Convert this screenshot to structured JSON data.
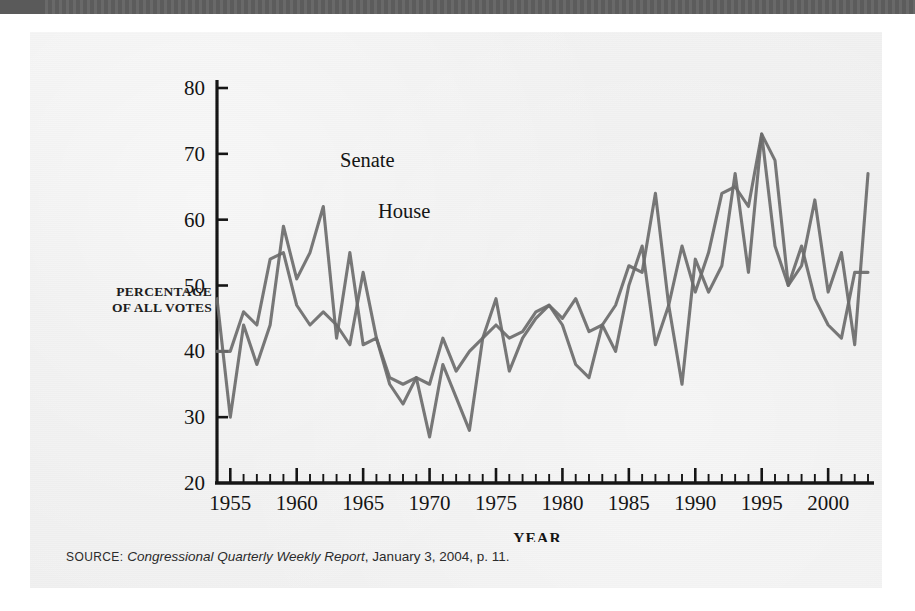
{
  "topbar": {
    "present": true,
    "color": "#5a5a5a"
  },
  "figure": {
    "panel_color": "#efefef",
    "y_axis_title_line1": "PERCENTAGE",
    "y_axis_title_line2": "OF ALL VOTES",
    "x_axis_title": "YEAR",
    "source_prefix": "SOURCE:",
    "source_italic": "Congressional Quarterly Weekly Report",
    "source_rest": ", January 3, 2004, p. 11.",
    "series_label_senate": "Senate",
    "series_label_house": "House",
    "line_color": "#6b6b6b",
    "axis_color": "#141414"
  },
  "chart_data": {
    "type": "line",
    "title": "",
    "xlabel": "YEAR",
    "ylabel": "PERCENTAGE OF ALL VOTES",
    "xlim": [
      1954,
      2003
    ],
    "ylim": [
      20,
      80
    ],
    "yticks": [
      20,
      30,
      40,
      50,
      60,
      70,
      80
    ],
    "xticks_major": [
      1955,
      1960,
      1965,
      1970,
      1975,
      1980,
      1985,
      1990,
      1995,
      2000
    ],
    "xtick_minor_step": 1,
    "grid": false,
    "legend": "inline-labels",
    "x": [
      1954,
      1955,
      1956,
      1957,
      1958,
      1959,
      1960,
      1961,
      1962,
      1963,
      1964,
      1965,
      1966,
      1967,
      1968,
      1969,
      1970,
      1971,
      1972,
      1973,
      1974,
      1975,
      1976,
      1977,
      1978,
      1979,
      1980,
      1981,
      1982,
      1983,
      1984,
      1985,
      1986,
      1987,
      1988,
      1989,
      1990,
      1991,
      1992,
      1993,
      1994,
      1995,
      1996,
      1997,
      1998,
      1999,
      2000,
      2001,
      2002,
      2003
    ],
    "series": [
      {
        "name": "Senate",
        "values": [
          48,
          30,
          44,
          38,
          44,
          59,
          51,
          55,
          62,
          42,
          55,
          41,
          42,
          35,
          32,
          36,
          35,
          42,
          37,
          40,
          42,
          48,
          37,
          42,
          45,
          47,
          45,
          48,
          43,
          44,
          40,
          50,
          56,
          41,
          47,
          35,
          54,
          49,
          53,
          67,
          52,
          73,
          69,
          50,
          53,
          63,
          49,
          55,
          41,
          67
        ]
      },
      {
        "name": "House",
        "values": [
          40,
          40,
          46,
          44,
          54,
          55,
          47,
          44,
          46,
          44,
          41,
          52,
          42,
          36,
          35,
          36,
          27,
          38,
          33,
          28,
          42,
          44,
          42,
          43,
          46,
          47,
          44,
          38,
          36,
          44,
          47,
          53,
          52,
          64,
          47,
          56,
          49,
          55,
          64,
          65,
          62,
          73,
          56,
          50,
          56,
          48,
          44,
          42,
          52,
          52
        ]
      }
    ]
  }
}
